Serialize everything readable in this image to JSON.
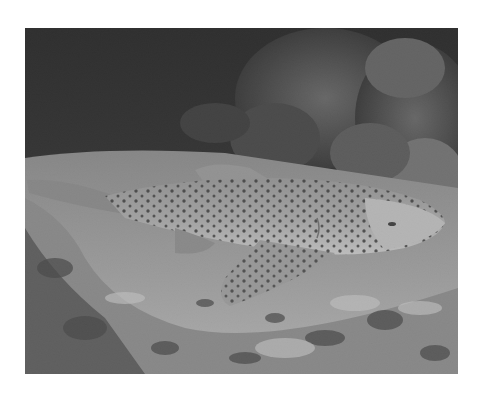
{
  "image": {
    "alt": "Black and white underwater photograph of a spotted leopard (zebra) shark resting on a sandy, rubble-strewn sea floor in front of dark coral heads",
    "subject": "leopard shark",
    "palette": {
      "background": "#ffffff",
      "water": "#0a0a0a",
      "coral": "#3a3a3a",
      "sand": "#b8b8b8",
      "shark_body": "#a8a8a8",
      "shark_belly": "#d6d6d6",
      "spots": "#1e1e1e"
    }
  }
}
